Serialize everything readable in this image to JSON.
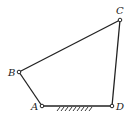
{
  "diagram": {
    "type": "four-bar-linkage",
    "colors": {
      "line": "#222222",
      "background": "#ffffff"
    },
    "joints": [
      {
        "id": "A",
        "label": "A",
        "x": 42,
        "y": 106
      },
      {
        "id": "B",
        "label": "B",
        "x": 19,
        "y": 72
      },
      {
        "id": "C",
        "label": "C",
        "x": 120,
        "y": 20
      },
      {
        "id": "D",
        "label": "D",
        "x": 112,
        "y": 106
      }
    ],
    "links": [
      {
        "from": "A",
        "to": "B"
      },
      {
        "from": "B",
        "to": "C"
      },
      {
        "from": "C",
        "to": "D"
      },
      {
        "from": "A",
        "to": "D",
        "ground": true
      }
    ],
    "labels": {
      "A": "A",
      "B": "B",
      "C": "C",
      "D": "D"
    }
  }
}
